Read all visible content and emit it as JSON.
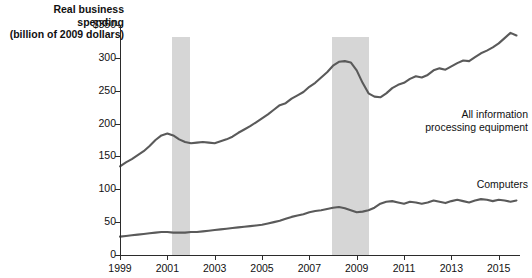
{
  "chart_data": {
    "type": "line",
    "title": "Real business spending (billion of 2009 dollars)",
    "title_line1": "Real business spending",
    "title_line2": "(billion of 2009 dollars)",
    "xlabel": "",
    "ylabel": "Real business spending (billion of 2009 dollars)",
    "xlim": [
      1999,
      2015.9
    ],
    "ylim": [
      0,
      350
    ],
    "grid": false,
    "legend_position": "inline-right",
    "y_ticks": [
      0,
      50,
      100,
      150,
      200,
      250,
      300,
      350
    ],
    "y_tick_labels": [
      "0",
      "50",
      "100",
      "150",
      "200",
      "250",
      "300",
      "$350"
    ],
    "x_ticks": [
      1999,
      2001,
      2003,
      2005,
      2007,
      2009,
      2011,
      2013,
      2015
    ],
    "x_tick_labels": [
      "1999",
      "2001",
      "2003",
      "2005",
      "2007",
      "2009",
      "2011",
      "2013",
      "2015"
    ],
    "shaded_regions": [
      {
        "name": "recession-2001",
        "start": 1201.2,
        "end": 1201.9,
        "x0": 2001.2,
        "x1": 2001.95,
        "color": "#d6d6d6"
      },
      {
        "name": "recession-2008",
        "start": 2007.95,
        "end": 2009.5,
        "x0": 2007.95,
        "x1": 2009.5,
        "color": "#d6d6d6"
      }
    ],
    "series": [
      {
        "name": "All information processing equipment",
        "label_line1": "All information",
        "label_line2": "processing equipment",
        "color": "#5a5a5a",
        "x": [
          1999.0,
          1999.25,
          1999.5,
          1999.75,
          2000.0,
          2000.25,
          2000.5,
          2000.75,
          2001.0,
          2001.25,
          2001.5,
          2001.75,
          2002.0,
          2002.25,
          2002.5,
          2002.75,
          2003.0,
          2003.25,
          2003.5,
          2003.75,
          2004.0,
          2004.25,
          2004.5,
          2004.75,
          2005.0,
          2005.25,
          2005.5,
          2005.75,
          2006.0,
          2006.25,
          2006.5,
          2006.75,
          2007.0,
          2007.25,
          2007.5,
          2007.75,
          2008.0,
          2008.25,
          2008.5,
          2008.75,
          2009.0,
          2009.25,
          2009.5,
          2009.75,
          2010.0,
          2010.25,
          2010.5,
          2010.75,
          2011.0,
          2011.25,
          2011.5,
          2011.75,
          2012.0,
          2012.25,
          2012.5,
          2012.75,
          2013.0,
          2013.25,
          2013.5,
          2013.75,
          2014.0,
          2014.25,
          2014.5,
          2014.75,
          2015.0,
          2015.25,
          2015.5,
          2015.75
        ],
        "values": [
          135,
          141,
          146,
          152,
          158,
          166,
          175,
          182,
          185,
          182,
          176,
          172,
          170,
          171,
          172,
          171,
          170,
          173,
          176,
          180,
          186,
          191,
          196,
          202,
          208,
          214,
          221,
          228,
          231,
          238,
          243,
          248,
          256,
          262,
          270,
          278,
          288,
          294,
          295,
          293,
          281,
          262,
          246,
          241,
          240,
          246,
          254,
          259,
          262,
          268,
          272,
          270,
          274,
          281,
          284,
          282,
          287,
          292,
          296,
          295,
          301,
          307,
          311,
          316,
          322,
          330,
          338,
          334
        ]
      },
      {
        "name": "Computers",
        "label_line1": "Computers",
        "color": "#5a5a5a",
        "x": [
          1999.0,
          1999.25,
          1999.5,
          1999.75,
          2000.0,
          2000.25,
          2000.5,
          2000.75,
          2001.0,
          2001.25,
          2001.5,
          2001.75,
          2002.0,
          2002.25,
          2002.5,
          2002.75,
          2003.0,
          2003.25,
          2003.5,
          2003.75,
          2004.0,
          2004.25,
          2004.5,
          2004.75,
          2005.0,
          2005.25,
          2005.5,
          2005.75,
          2006.0,
          2006.25,
          2006.5,
          2006.75,
          2007.0,
          2007.25,
          2007.5,
          2007.75,
          2008.0,
          2008.25,
          2008.5,
          2008.75,
          2009.0,
          2009.25,
          2009.5,
          2009.75,
          2010.0,
          2010.25,
          2010.5,
          2010.75,
          2011.0,
          2011.25,
          2011.5,
          2011.75,
          2012.0,
          2012.25,
          2012.5,
          2012.75,
          2013.0,
          2013.25,
          2013.5,
          2013.75,
          2014.0,
          2014.25,
          2014.5,
          2014.75,
          2015.0,
          2015.25,
          2015.5,
          2015.75
        ],
        "values": [
          28,
          29,
          30,
          31,
          32,
          33,
          34,
          35,
          35,
          34,
          34,
          34,
          35,
          35,
          36,
          37,
          38,
          39,
          40,
          41,
          42,
          43,
          44,
          45,
          46,
          48,
          50,
          52,
          55,
          58,
          60,
          62,
          65,
          67,
          68,
          70,
          72,
          73,
          71,
          68,
          65,
          66,
          68,
          72,
          78,
          81,
          82,
          80,
          78,
          81,
          80,
          78,
          80,
          83,
          81,
          79,
          82,
          84,
          82,
          80,
          83,
          85,
          84,
          82,
          84,
          83,
          81,
          83
        ]
      }
    ]
  }
}
